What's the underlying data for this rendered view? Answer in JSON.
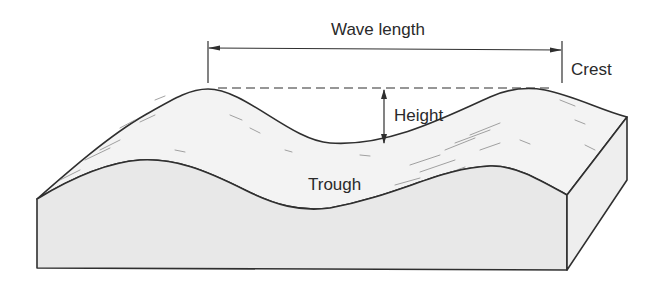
{
  "diagram": {
    "labels": {
      "wave_length": "Wave length",
      "crest": "Crest",
      "height": "Height",
      "trough": "Trough"
    },
    "colors": {
      "line": "#2f2f2f",
      "surface_top": "#f4f4f4",
      "front_face": "#e6e6e6",
      "side_face": "#ececec",
      "background": "#ffffff"
    }
  }
}
